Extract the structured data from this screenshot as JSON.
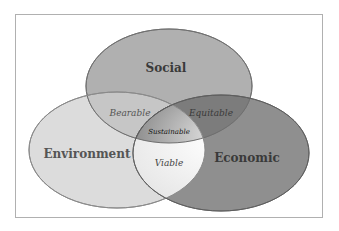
{
  "diagram": {
    "type": "venn",
    "circles": [
      {
        "id": "social",
        "label": "Social",
        "color": "#a8a8a8"
      },
      {
        "id": "environment",
        "label": "Environment",
        "color": "#d4d4d4"
      },
      {
        "id": "economic",
        "label": "Economic",
        "color": "#8c8c8c"
      }
    ],
    "intersections": {
      "social_environment": "Bearable",
      "social_economic": "Equitable",
      "environment_economic": "Viable",
      "all": "Sustainable"
    }
  }
}
